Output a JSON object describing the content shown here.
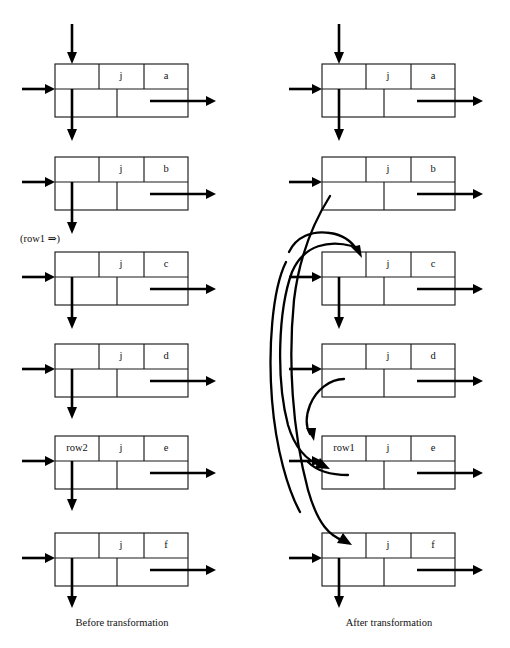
{
  "figure": {
    "captions": {
      "left": "Before transformation",
      "right": "After transformation"
    },
    "annotations": {
      "row1_pointer": "(row1 ⇒)"
    }
  },
  "columns": [
    {
      "id": "before",
      "caption": "Before transformation",
      "boxes": [
        {
          "id": "before-a",
          "left_label": "",
          "mid_label": "j",
          "right_label": "a",
          "has_top_arrow": true,
          "has_left_arrow": true,
          "has_right_arrow": true,
          "has_bottom_arrow": true
        },
        {
          "id": "before-b",
          "left_label": "",
          "mid_label": "j",
          "right_label": "b",
          "has_top_arrow": false,
          "has_left_arrow": true,
          "has_right_arrow": true,
          "has_bottom_arrow": true
        },
        {
          "id": "before-c",
          "left_label": "",
          "mid_label": "j",
          "right_label": "c",
          "has_top_arrow": false,
          "has_left_arrow": true,
          "has_right_arrow": true,
          "has_bottom_arrow": true
        },
        {
          "id": "before-d",
          "left_label": "",
          "mid_label": "j",
          "right_label": "d",
          "has_top_arrow": false,
          "has_left_arrow": true,
          "has_right_arrow": true,
          "has_bottom_arrow": true
        },
        {
          "id": "before-e",
          "left_label": "row2",
          "mid_label": "j",
          "right_label": "e",
          "has_top_arrow": false,
          "has_left_arrow": true,
          "has_right_arrow": true,
          "has_bottom_arrow": true
        },
        {
          "id": "before-f",
          "left_label": "",
          "mid_label": "j",
          "right_label": "f",
          "has_top_arrow": false,
          "has_left_arrow": true,
          "has_right_arrow": true,
          "has_bottom_arrow": true
        }
      ]
    },
    {
      "id": "after",
      "caption": "After transformation",
      "boxes": [
        {
          "id": "after-a",
          "left_label": "",
          "mid_label": "j",
          "right_label": "a",
          "has_top_arrow": true,
          "has_left_arrow": true,
          "has_right_arrow": true,
          "has_bottom_arrow": true
        },
        {
          "id": "after-b",
          "left_label": "",
          "mid_label": "j",
          "right_label": "b",
          "has_top_arrow": false,
          "has_left_arrow": true,
          "has_right_arrow": true,
          "has_bottom_arrow": false
        },
        {
          "id": "after-c",
          "left_label": "",
          "mid_label": "j",
          "right_label": "c",
          "has_top_arrow": false,
          "has_left_arrow": true,
          "has_right_arrow": true,
          "has_bottom_arrow": true
        },
        {
          "id": "after-d",
          "left_label": "",
          "mid_label": "j",
          "right_label": "d",
          "has_top_arrow": false,
          "has_left_arrow": true,
          "has_right_arrow": true,
          "has_bottom_arrow": false
        },
        {
          "id": "after-e",
          "left_label": "row1",
          "mid_label": "j",
          "right_label": "e",
          "has_top_arrow": false,
          "has_left_arrow": true,
          "has_right_arrow": true,
          "has_bottom_arrow": false
        },
        {
          "id": "after-f",
          "left_label": "",
          "mid_label": "j",
          "right_label": "f",
          "has_top_arrow": false,
          "has_left_arrow": true,
          "has_right_arrow": true,
          "has_bottom_arrow": true
        }
      ]
    }
  ],
  "colors": {
    "stroke": "#1a1a1a",
    "arrow": "#000000",
    "background": "#ffffff"
  }
}
